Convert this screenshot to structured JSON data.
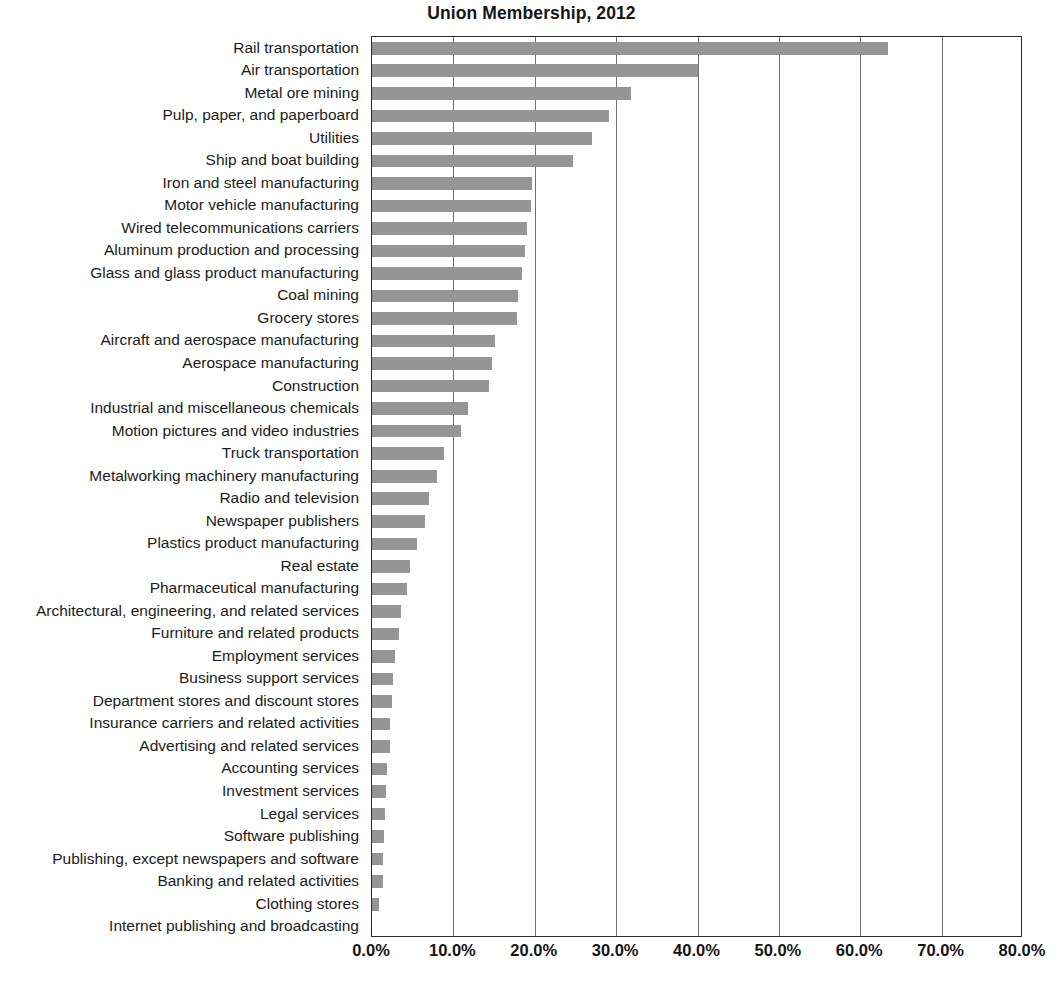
{
  "chart_data": {
    "type": "bar",
    "orientation": "horizontal",
    "title": "Union Membership, 2012",
    "xlabel": "",
    "ylabel": "",
    "xlim": [
      0,
      80
    ],
    "xticks": [
      "0.0%",
      "10.0%",
      "20.0%",
      "30.0%",
      "40.0%",
      "50.0%",
      "60.0%",
      "70.0%",
      "80.0%"
    ],
    "xtick_values": [
      0,
      10,
      20,
      30,
      40,
      50,
      60,
      70,
      80
    ],
    "grid": "vertical",
    "legend": "none",
    "bar_color": "#959595",
    "categories": [
      "Rail transportation",
      "Air transportation",
      "Metal ore mining",
      "Pulp, paper, and paperboard",
      "Utilities",
      "Ship and boat building",
      "Iron and steel manufacturing",
      "Motor vehicle manufacturing",
      "Wired telecommunications carriers",
      "Aluminum production and processing",
      "Glass and glass product manufacturing",
      "Coal mining",
      "Grocery stores",
      "Aircraft and aerospace manufacturing",
      "Aerospace manufacturing",
      "Construction",
      "Industrial and miscellaneous chemicals",
      "Motion pictures and video industries",
      "Truck transportation",
      "Metalworking machinery manufacturing",
      "Radio and television",
      "Newspaper publishers",
      "Plastics product manufacturing",
      "Real estate",
      "Pharmaceutical manufacturing",
      "Architectural, engineering, and related services",
      "Furniture and related products",
      "Employment services",
      "Business support services",
      "Department stores and discount stores",
      "Insurance carriers and related activities",
      "Advertising and related services",
      "Accounting services",
      "Investment services",
      "Legal services",
      "Software publishing",
      "Publishing, except newspapers and software",
      "Banking and related activities",
      "Clothing stores",
      "Internet publishing and broadcasting"
    ],
    "values": [
      63.4,
      40.0,
      31.8,
      29.1,
      27.0,
      24.7,
      19.7,
      19.6,
      19.1,
      18.8,
      18.4,
      17.9,
      17.8,
      15.1,
      14.8,
      14.4,
      11.8,
      10.9,
      8.8,
      8.0,
      7.0,
      6.5,
      5.5,
      4.7,
      4.3,
      3.6,
      3.3,
      2.8,
      2.6,
      2.5,
      2.2,
      2.2,
      1.9,
      1.7,
      1.6,
      1.5,
      1.4,
      1.3,
      0.9,
      0.0
    ]
  }
}
